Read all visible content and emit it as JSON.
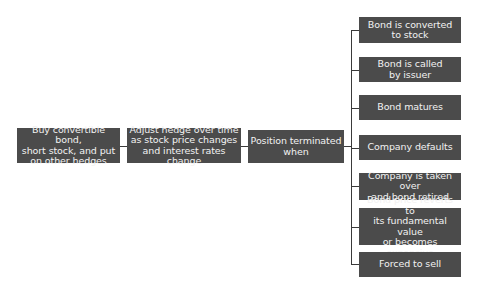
{
  "diagram": {
    "type": "flowchart",
    "colors": {
      "box_fill": "#4b4b4b",
      "box_text": "#f2f2f2",
      "connector": "#3a3a3a",
      "background": "#ffffff"
    },
    "steps": [
      {
        "id": "step1",
        "label": "Buy convertible bond,\nshort stock, and put\non other hedges"
      },
      {
        "id": "step2",
        "label": "Adjust hedge over time\nas stock price changes\nand interest rates change"
      },
      {
        "id": "step3",
        "label": "Position terminated\nwhen"
      }
    ],
    "outcomes": [
      {
        "id": "outcome1",
        "label": "Bond is converted\nto stock"
      },
      {
        "id": "outcome2",
        "label": "Bond is called\nby issuer"
      },
      {
        "id": "outcome3",
        "label": "Bond matures"
      },
      {
        "id": "outcome4",
        "label": "Company defaults"
      },
      {
        "id": "outcome5",
        "label": "Company is taken over\nand bond retired"
      },
      {
        "id": "outcome6",
        "label": "Bond price reverts to\nits fundamental value\nor becomes expensive"
      },
      {
        "id": "outcome7",
        "label": "Forced to sell"
      }
    ]
  }
}
